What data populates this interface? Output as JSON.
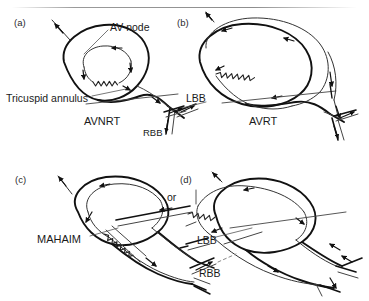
{
  "figure": {
    "kind": "diagram",
    "width": 369,
    "height": 301,
    "background_color": "#ffffff",
    "line_color": "#111111",
    "thin_line_color": "#444444",
    "text_color": "#1a1a1a"
  },
  "panels": [
    {
      "id": "a",
      "letter": "(a)",
      "letter_x": 14,
      "letter_y": 18,
      "name": "AVNRT",
      "name_x": 84,
      "name_y": 122,
      "labels": [
        {
          "text": "AV node",
          "x": 110,
          "y": 27
        },
        {
          "text": "Tricuspid annulus",
          "x": 6,
          "y": 98
        },
        {
          "text": "RBB",
          "x": 143,
          "y": 133
        }
      ]
    },
    {
      "id": "b",
      "letter": "(b)",
      "letter_x": 177,
      "letter_y": 18,
      "name": "AVRT",
      "name_x": 249,
      "name_y": 122,
      "labels": [
        {
          "text": "LBB",
          "x": 186,
          "y": 98
        }
      ]
    },
    {
      "id": "c",
      "letter": "(c)",
      "letter_x": 15,
      "letter_y": 175,
      "name": "MAHAIM",
      "name_x": 37,
      "name_y": 240,
      "labels": []
    },
    {
      "id": "d",
      "letter": "(d)",
      "letter_x": 180,
      "letter_y": 175,
      "name": "",
      "name_x": 0,
      "name_y": 0,
      "labels": [
        {
          "text": "or",
          "x": 167,
          "y": 196
        },
        {
          "text": "LBB",
          "x": 197,
          "y": 240
        },
        {
          "text": "RBB",
          "x": 199,
          "y": 273
        }
      ]
    }
  ],
  "all_text_labels": [
    "(a)",
    "AV node",
    "Tricuspid annulus",
    "AVNRT",
    "RBB",
    "(b)",
    "LBB",
    "AVRT",
    "(c)",
    "MAHAIM",
    "(d)",
    "or",
    "LBB",
    "RBB"
  ],
  "graphic_elements": {
    "atrial_outline": "teardrop-shaped chamber outline",
    "reentry_circuit": "closed loop with filled triangular arrowheads indicating conduction direction",
    "slow_pathway": "zigzag / sawtooth line segment",
    "bundle_branches": "paired parallel thin lines leading to RBB and LBB",
    "annulus_line": "straight oblique line crossing the chamber base",
    "arrowhead_style": "solid filled triangle"
  }
}
